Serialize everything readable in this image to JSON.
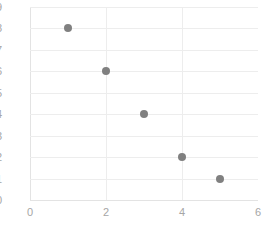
{
  "chart_data": {
    "type": "scatter",
    "title": "",
    "subtitle": "",
    "xlabel": "",
    "ylabel": "",
    "x": [
      1,
      2,
      3,
      4,
      5
    ],
    "values": [
      8,
      6,
      4,
      2,
      1
    ],
    "points": [
      {
        "x": 1,
        "y": 8
      },
      {
        "x": 2,
        "y": 6
      },
      {
        "x": 3,
        "y": 4
      },
      {
        "x": 4,
        "y": 2
      },
      {
        "x": 5,
        "y": 1
      }
    ],
    "series": [
      {
        "name": "",
        "x": [
          1,
          2,
          3,
          4,
          5
        ],
        "values": [
          8,
          6,
          4,
          2,
          1
        ]
      }
    ],
    "xlim": [
      0,
      6
    ],
    "ylim": [
      0,
      9
    ],
    "xticks": [
      0,
      2,
      4,
      6
    ],
    "yticks": [
      0,
      1,
      2,
      3,
      4,
      5,
      6,
      7,
      8,
      9
    ],
    "xtick_labels": [
      "0",
      "2",
      "4",
      "6"
    ],
    "ytick_labels": [
      "0",
      "1",
      "2",
      "3",
      "4",
      "5",
      "6",
      "7",
      "8",
      "9"
    ],
    "grid": {
      "horizontal": true,
      "vertical": true,
      "vertical_at": [
        2,
        4
      ],
      "horizontal_at": [
        1,
        2,
        3,
        4,
        5,
        6,
        7,
        8,
        9
      ]
    },
    "legend": {
      "visible": false,
      "position": "none"
    },
    "annotations": [],
    "colors": {
      "marker": "#808080",
      "gridline": "#ededed",
      "axis_line": "#e3e3e3",
      "tick_label": "#a6a6a6",
      "background": "#ffffff"
    },
    "marker_style": {
      "shape": "circle",
      "size_px": 8
    }
  }
}
